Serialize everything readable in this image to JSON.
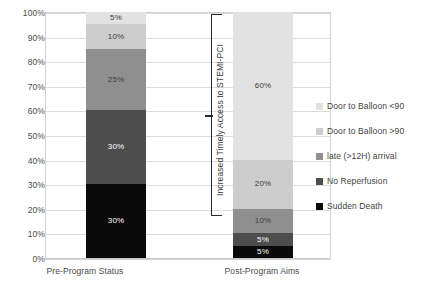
{
  "chart_data": {
    "type": "bar",
    "subtype": "stacked-100-percent",
    "title": "",
    "xlabel": "",
    "ylabel": "",
    "categories": [
      "Pre-Program Status",
      "Post-Program Aims"
    ],
    "ylim": [
      0,
      100
    ],
    "ytick_labels": [
      "0%",
      "10%",
      "20%",
      "30%",
      "40%",
      "50%",
      "60%",
      "70%",
      "80%",
      "90%",
      "100%"
    ],
    "ytick_values": [
      0,
      10,
      20,
      30,
      40,
      50,
      60,
      70,
      80,
      90,
      100
    ],
    "grid": true,
    "legend_position": "right",
    "series": [
      {
        "name": "Door to Balloon <90",
        "color": "#e2e2e2",
        "label_color": "dark",
        "values": [
          5,
          60
        ],
        "labels": [
          "5%",
          "60%"
        ]
      },
      {
        "name": "Door to Balloon >90",
        "color": "#cdcdcd",
        "label_color": "dark",
        "values": [
          10,
          20
        ],
        "labels": [
          "10%",
          "20%"
        ]
      },
      {
        "name": "late (>12H) arrival",
        "color": "#8f8f8f",
        "label_color": "dark",
        "values": [
          25,
          10
        ],
        "labels": [
          "25%",
          "10%"
        ]
      },
      {
        "name": "No Reperfusion",
        "color": "#4d4d4d",
        "label_color": "light",
        "values": [
          30,
          5
        ],
        "labels": [
          "30%",
          "5%"
        ]
      },
      {
        "name": "Sudden Death",
        "color": "#0a0a0a",
        "label_color": "light",
        "values": [
          30,
          5
        ],
        "labels": [
          "30%",
          "5%"
        ]
      }
    ],
    "legend_order": [
      "Door to Balloon <90",
      "Door to Balloon >90",
      "late (>12H) arrival",
      "No Reperfusion",
      "Sudden Death"
    ],
    "annotations": [
      {
        "text": "Increased Timely Access to STEMI-PCI",
        "orientation": "vertical",
        "bracket_from": 100,
        "bracket_to": 20
      }
    ]
  },
  "legend": {
    "items": [
      {
        "label": "Door to Balloon <90",
        "color": "#e2e2e2"
      },
      {
        "label": "Door to Balloon >90",
        "color": "#cdcdcd"
      },
      {
        "label": "late (>12H) arrival",
        "color": "#8f8f8f"
      },
      {
        "label": "No Reperfusion",
        "color": "#4d4d4d"
      },
      {
        "label": "Sudden Death",
        "color": "#0a0a0a"
      }
    ]
  }
}
